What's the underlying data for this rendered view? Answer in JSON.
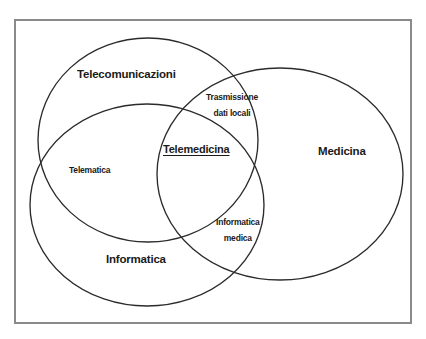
{
  "diagram": {
    "type": "venn",
    "title_present": false,
    "background_color": "#ffffff",
    "frame": {
      "stroke_color": "#8a8a8a",
      "x": 15,
      "y": 20,
      "width": 396,
      "height": 303
    },
    "stroke_color": "#2b2b2b",
    "text_color": "#1a1a1a",
    "sets": [
      {
        "id": "telecomunicazioni",
        "label": "Telecomunicazioni",
        "label_x": 77,
        "label_y": 76,
        "cx": 148,
        "cy": 140,
        "rx": 110,
        "ry": 102
      },
      {
        "id": "medicina",
        "label": "Medicina",
        "label_x": 318,
        "label_y": 153,
        "cx": 280,
        "cy": 174,
        "rx": 123,
        "ry": 106
      },
      {
        "id": "informatica",
        "label": "Informatica",
        "label_x": 106,
        "label_y": 261,
        "cx": 147,
        "cy": 205,
        "rx": 117,
        "ry": 101
      }
    ],
    "intersections": [
      {
        "id": "trasmissione-dati-locali",
        "lines": [
          "Trasmissione",
          "dati locali"
        ],
        "label": "Trasmissione dati locali",
        "label_x": 206,
        "label_y": 92,
        "between": [
          "telecomunicazioni",
          "medicina"
        ]
      },
      {
        "id": "telematica",
        "lines": [
          "Telematica"
        ],
        "label": "Telematica",
        "label_x": 69,
        "label_y": 169,
        "between": [
          "telecomunicazioni",
          "informatica"
        ]
      },
      {
        "id": "informatica-medica",
        "lines": [
          "Informatica",
          "medica"
        ],
        "label": "Informatica medica",
        "label_x": 216,
        "label_y": 217,
        "between": [
          "informatica",
          "medicina"
        ]
      },
      {
        "id": "telemedicina",
        "lines": [
          "Telemedicina"
        ],
        "label": "Telemedicina",
        "label_x": 163,
        "label_y": 150,
        "underlined": true,
        "between": [
          "telecomunicazioni",
          "medicina",
          "informatica"
        ]
      }
    ]
  }
}
